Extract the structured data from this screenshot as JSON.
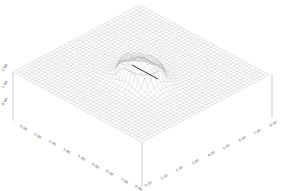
{
  "chart_data": {
    "type": "surface-wireframe-3d",
    "title": "",
    "xlabel": "",
    "ylabel": "",
    "zlabel": "",
    "x_ticks": [
      "0.00",
      "1.00",
      "2.00",
      "3.00",
      "4.00",
      "5.00",
      "6.00",
      "7.00",
      "8.00"
    ],
    "y_ticks": [
      "0.00",
      "1.00",
      "2.00",
      "3.00",
      "4.00",
      "5.00",
      "6.00",
      "7.00",
      "8.00"
    ],
    "z_ticks": [
      "0.00",
      "1.00",
      "2.00"
    ],
    "grid_resolution": 40,
    "surface_description": "Flat plane with a localized raised ridge/bump near the center; a short dark line segment marks the crest of the feature",
    "feature": {
      "center": [
        0.55,
        0.45
      ],
      "amplitude": 1.0,
      "crest_line": {
        "from": [
          0.45,
          0.38
        ],
        "to": [
          0.62,
          0.52
        ]
      }
    },
    "colors": {
      "mesh": "#9a9a9a",
      "mesh_dense": "#6f6f6f",
      "crest": "#222222",
      "axis": "#888888",
      "label": "#555555"
    }
  }
}
